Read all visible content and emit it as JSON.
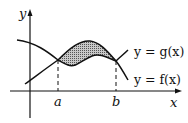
{
  "diagram": {
    "axes": {
      "x_label": "x",
      "y_label": "y"
    },
    "points": {
      "a_label": "a",
      "b_label": "b"
    },
    "curves": [
      {
        "name": "g",
        "label": "y = g(x)"
      },
      {
        "name": "f",
        "label": "y = f(x)"
      }
    ],
    "shaded_region": "between f (top) and g (bottom) from a to b",
    "colors": {
      "ink": "#111111",
      "shade": "#9a9a9a"
    }
  }
}
